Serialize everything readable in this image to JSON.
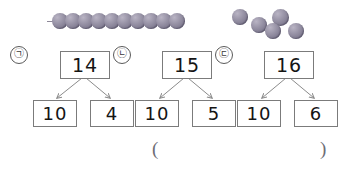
{
  "worksheet": {
    "title": "Number decomposition with beads",
    "bead_string": {
      "label": "ten-bead-string",
      "count": 10,
      "bead_color": "#9a95a8",
      "string_color": "#8d8898"
    },
    "loose_beads": {
      "label": "loose-beads-group",
      "count": 5,
      "bead_color": "#9a95a8"
    },
    "groups": [
      {
        "marker": "㉠",
        "whole": "14",
        "part_left": "10",
        "part_right": "4"
      },
      {
        "marker": "㉡",
        "whole": "15",
        "part_left": "10",
        "part_right": "5"
      },
      {
        "marker": "㉢",
        "whole": "16",
        "part_left": "10",
        "part_right": "6"
      }
    ],
    "answer_blank": {
      "open_paren": "(",
      "close_paren": ")",
      "value": ""
    }
  }
}
